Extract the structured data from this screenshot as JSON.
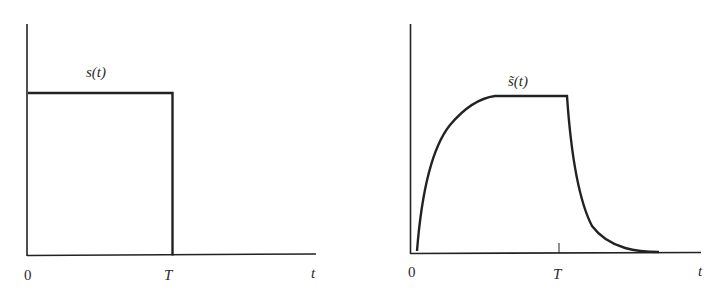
{
  "figure": {
    "left_plot": {
      "signal_label": "s(t)",
      "origin_label": "0",
      "T_label": "T",
      "axis_label": "t",
      "shape": "rectangular-pulse"
    },
    "right_plot": {
      "signal_label": "s̃(t)",
      "origin_label": "0",
      "T_label": "T",
      "axis_label": "t",
      "shape": "exponential-rise-and-decay-pulse"
    },
    "stroke_color": "#222222"
  }
}
